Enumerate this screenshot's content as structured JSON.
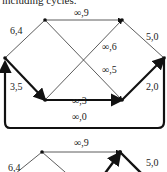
{
  "caption": "including cycles.",
  "graph1": {
    "edges": [
      {
        "id": "a",
        "label": "6,4"
      },
      {
        "id": "b",
        "label": "∞,9"
      },
      {
        "id": "c",
        "label": "5,0"
      },
      {
        "id": "d",
        "label": "∞,6"
      },
      {
        "id": "e",
        "label": "∞,5"
      },
      {
        "id": "f",
        "label": "3,5"
      },
      {
        "id": "g",
        "label": "∞,3"
      },
      {
        "id": "h",
        "label": "2,0"
      },
      {
        "id": "i",
        "label": "∞,0"
      }
    ]
  },
  "graph2": {
    "edges": [
      {
        "id": "a",
        "label": "6,4"
      },
      {
        "id": "b",
        "label": "∞,9"
      },
      {
        "id": "c",
        "label": "5,0"
      }
    ]
  }
}
